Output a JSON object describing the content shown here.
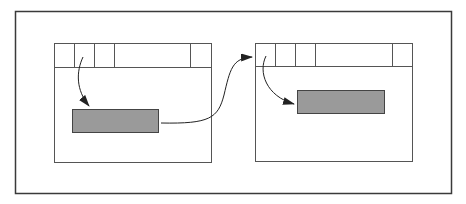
{
  "diagram": {
    "colors": {
      "frame": "#3a3a3a",
      "window_stroke": "#555555",
      "panel_fill": "#9a9a9a",
      "panel_stroke": "#444444",
      "arrow": "#222222",
      "background": "#ffffff"
    },
    "windows": [
      {
        "id": "left-window",
        "header_cells": 5,
        "panel": "highlighted-panel"
      },
      {
        "id": "right-window",
        "header_cells": 5,
        "panel": "highlighted-panel"
      }
    ],
    "arrows": [
      {
        "from": "left-window.header-cell-2",
        "to": "left-window.panel"
      },
      {
        "from": "left-window.panel",
        "to": "right-window.header"
      },
      {
        "from": "right-window.header-cell-1",
        "to": "right-window.panel"
      }
    ]
  }
}
